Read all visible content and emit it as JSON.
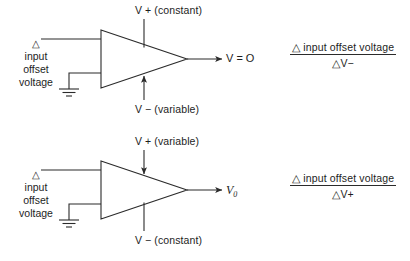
{
  "diagram": {
    "line_color": "#2b2b2b",
    "text_color": "#1d1d1d",
    "background": "#ffffff"
  },
  "circuits": [
    {
      "id": "top",
      "input_label": {
        "delta": "△",
        "lines": [
          "input",
          "offset",
          "voltage"
        ]
      },
      "positive_supply": {
        "symbol": "V +",
        "qualifier": "(constant)",
        "text": "V + (constant)",
        "arrow": "none"
      },
      "negative_supply": {
        "symbol": "V −",
        "qualifier": "(variable)",
        "text": "V − (variable)",
        "arrow": "up"
      },
      "output_label": {
        "symbol": "V",
        "relation": "=",
        "value": "O",
        "text": "V = O",
        "subscript": ""
      },
      "ground": "ground-symbol",
      "formula": {
        "numerator": "△ input offset voltage",
        "denominator": "△V−",
        "denominator_delta": "△",
        "denominator_var": "V",
        "denominator_sign": "−"
      }
    },
    {
      "id": "bottom",
      "input_label": {
        "delta": "△",
        "lines": [
          "input",
          "offset",
          "voltage"
        ]
      },
      "positive_supply": {
        "symbol": "V +",
        "qualifier": "(variable)",
        "text": "V + (variable)",
        "arrow": "down"
      },
      "negative_supply": {
        "symbol": "V −",
        "qualifier": "(constant)",
        "text": "V − (constant)",
        "arrow": "none"
      },
      "output_label": {
        "symbol": "V",
        "relation": "",
        "value": "",
        "text": "V",
        "subscript": "0"
      },
      "ground": "ground-symbol",
      "formula": {
        "numerator": "△ input offset voltage",
        "denominator": "△V+",
        "denominator_delta": "△",
        "denominator_var": "V",
        "denominator_sign": "+"
      }
    }
  ]
}
